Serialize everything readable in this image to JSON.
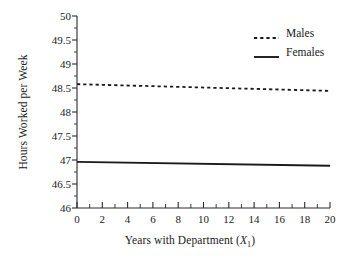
{
  "chart_data": {
    "type": "line",
    "title": "",
    "xlabel": "Years with Department (X₁)",
    "xlabel_prefix": "Years with Department (",
    "xlabel_var": "X",
    "xlabel_sub": "1",
    "xlabel_suffix": ")",
    "ylabel": "Hours Worked per Week",
    "xlim": [
      0,
      20
    ],
    "ylim": [
      46,
      50
    ],
    "xticks": [
      0,
      2,
      4,
      6,
      8,
      10,
      12,
      14,
      16,
      18,
      20
    ],
    "xtick_labels": [
      "0",
      "2",
      "4",
      "6",
      "8",
      "10",
      "12",
      "14",
      "16",
      "18",
      "20"
    ],
    "xminor_ticks": [
      1,
      3,
      5,
      7,
      9,
      11,
      13,
      15,
      17,
      19
    ],
    "yticks": [
      46,
      46.5,
      47,
      47.5,
      48,
      48.5,
      49,
      49.5,
      50
    ],
    "ytick_labels": [
      "46",
      "46.5",
      "47",
      "47.5",
      "48",
      "48.5",
      "49",
      "49.5",
      "50"
    ],
    "grid": false,
    "legend_position": "top-right",
    "series": [
      {
        "name": "Males",
        "style": "dashed",
        "color": "#1a1a1a",
        "x": [
          0,
          20
        ],
        "values": [
          48.58,
          48.44
        ]
      },
      {
        "name": "Females",
        "style": "solid",
        "color": "#1a1a1a",
        "x": [
          0,
          20
        ],
        "values": [
          46.96,
          46.88
        ]
      }
    ]
  },
  "legend": {
    "items": [
      {
        "label": "Males",
        "style": "dashed"
      },
      {
        "label": "Females",
        "style": "solid"
      }
    ]
  }
}
